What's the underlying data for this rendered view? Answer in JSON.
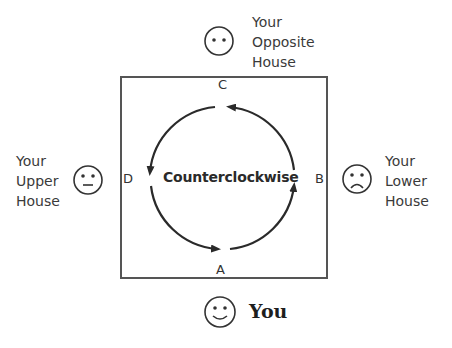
{
  "diagram": {
    "center_label": "Counterclockwise",
    "corners": {
      "top": "C",
      "right": "B",
      "bottom": "A",
      "left": "D"
    },
    "people": {
      "top": {
        "lines": [
          "Your",
          "Opposite",
          "House"
        ],
        "face": "neutral-dots"
      },
      "left": {
        "lines": [
          "Your",
          "Upper",
          "House"
        ],
        "face": "neutral"
      },
      "right": {
        "lines": [
          "Your",
          "Lower",
          "House"
        ],
        "face": "sad"
      },
      "bottom": {
        "label": "You",
        "face": "happy"
      }
    },
    "direction": "counterclockwise"
  }
}
